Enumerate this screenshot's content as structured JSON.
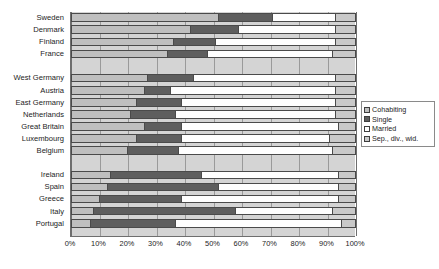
{
  "chart_data": {
    "type": "bar",
    "orientation": "horizontal",
    "stacked": true,
    "stack_total": 100,
    "title": "",
    "xlabel": "",
    "ylabel": "",
    "xlim": [
      0,
      100
    ],
    "xticks": [
      "0%",
      "10%",
      "20%",
      "30%",
      "40%",
      "50%",
      "60%",
      "70%",
      "80%",
      "90%",
      "100%"
    ],
    "xtick_values": [
      0,
      10,
      20,
      30,
      40,
      50,
      60,
      70,
      80,
      90,
      100
    ],
    "grid": true,
    "legend_position": "right",
    "legend": [
      "Cohabiting",
      "Single",
      "Married",
      "Sep., div., wid."
    ],
    "colors": [
      "#bfbfbf",
      "#5e5e5e",
      "#fefefe",
      "#c9c9c9"
    ],
    "categories": [
      "Sweden",
      "Denmark",
      "Finland",
      "France",
      "",
      "West Germany",
      "Austria",
      "East Germany",
      "Netherlands",
      "Great Britain",
      "Luxembourg",
      "Belgium",
      "",
      "Ireland",
      "Spain",
      "Greece",
      "Italy",
      "Portugal"
    ],
    "series": [
      {
        "name": "Cohabiting",
        "values": [
          52,
          42,
          36,
          34,
          null,
          27,
          26,
          23,
          21,
          26,
          23,
          20,
          null,
          14,
          13,
          10,
          8,
          7
        ]
      },
      {
        "name": "Single",
        "values": [
          19,
          17,
          15,
          14,
          null,
          16,
          9,
          16,
          16,
          13,
          16,
          18,
          null,
          32,
          39,
          29,
          50,
          30
        ]
      },
      {
        "name": "Married",
        "values": [
          22,
          34,
          42,
          44,
          null,
          50,
          58,
          54,
          56,
          55,
          52,
          54,
          null,
          48,
          42,
          55,
          34,
          58
        ]
      },
      {
        "name": "Sep., div., wid.",
        "values": [
          7,
          7,
          7,
          8,
          null,
          7,
          7,
          7,
          7,
          6,
          9,
          8,
          null,
          6,
          6,
          6,
          8,
          5
        ]
      }
    ]
  }
}
